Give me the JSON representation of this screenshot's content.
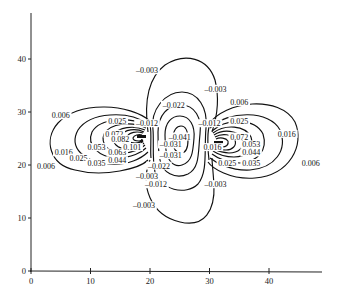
{
  "chart_data": {
    "type": "contour",
    "title": "",
    "xlabel": "",
    "ylabel": "",
    "xlim": [
      0,
      48
    ],
    "ylim": [
      0,
      48
    ],
    "grid": false,
    "legend": null,
    "x_ticks": [
      0,
      10,
      20,
      30,
      40
    ],
    "y_ticks": [
      0,
      10,
      20,
      30,
      40
    ],
    "sources": [
      {
        "name": "left-positive-source",
        "x": 18.5,
        "y": 25,
        "sign": "positive"
      },
      {
        "name": "right-positive-source",
        "x": 31.5,
        "y": 24,
        "sign": "positive"
      },
      {
        "name": "center-negative-region",
        "x": 25,
        "y": 24,
        "sign": "negative"
      }
    ],
    "contour_levels": [
      -0.041,
      -0.031,
      -0.022,
      -0.012,
      -0.003,
      0.006,
      0.016,
      0.025,
      0.035,
      0.044,
      0.053,
      0.063,
      0.072,
      0.082,
      0.091,
      0.101
    ],
    "contour_labels": [
      {
        "text": "-0.003",
        "x": 19.5,
        "y": 37.5
      },
      {
        "text": "-0.003",
        "x": 31,
        "y": 34
      },
      {
        "text": "-0.022",
        "x": 24,
        "y": 31
      },
      {
        "text": "-0.012",
        "x": 19.5,
        "y": 27.5
      },
      {
        "text": "-0.012",
        "x": 30,
        "y": 27.5
      },
      {
        "text": "-0.041",
        "x": 25,
        "y": 25
      },
      {
        "text": "-0.031",
        "x": 23.5,
        "y": 23.5
      },
      {
        "text": "-0.031",
        "x": 23.5,
        "y": 21.5
      },
      {
        "text": "-0.022",
        "x": 21.5,
        "y": 19.5
      },
      {
        "text": "-0.003",
        "x": 19.5,
        "y": 17.5
      },
      {
        "text": "-0.012",
        "x": 21,
        "y": 16
      },
      {
        "text": "-0.003",
        "x": 19,
        "y": 12
      },
      {
        "text": "-0.003",
        "x": 31,
        "y": 16
      },
      {
        "text": "0.006",
        "x": 5,
        "y": 29
      },
      {
        "text": "0.006",
        "x": 2.5,
        "y": 19.5
      },
      {
        "text": "0.016",
        "x": 5.5,
        "y": 22
      },
      {
        "text": "0.025",
        "x": 14.5,
        "y": 28
      },
      {
        "text": "0.025",
        "x": 8,
        "y": 21
      },
      {
        "text": "0.035",
        "x": 11,
        "y": 20
      },
      {
        "text": "0.044",
        "x": 14.5,
        "y": 20.5
      },
      {
        "text": "0.053",
        "x": 11,
        "y": 23
      },
      {
        "text": "0.063",
        "x": 14.5,
        "y": 22
      },
      {
        "text": "0.072",
        "x": 14,
        "y": 25.5
      },
      {
        "text": "0.082",
        "x": 15,
        "y": 24.5
      },
      {
        "text": "0.101",
        "x": 17,
        "y": 23
      },
      {
        "text": "0.006",
        "x": 35,
        "y": 31.5
      },
      {
        "text": "0.025",
        "x": 35,
        "y": 28
      },
      {
        "text": "0.016",
        "x": 43,
        "y": 25.5
      },
      {
        "text": "0.006",
        "x": 47,
        "y": 20
      },
      {
        "text": "0.072",
        "x": 35,
        "y": 25
      },
      {
        "text": "0.053",
        "x": 37,
        "y": 23.5
      },
      {
        "text": "0.044",
        "x": 37,
        "y": 22
      },
      {
        "text": "0.035",
        "x": 37,
        "y": 20
      },
      {
        "text": "0.025",
        "x": 33,
        "y": 20
      },
      {
        "text": "0.016",
        "x": 30.5,
        "y": 23
      }
    ]
  },
  "axes": {
    "x_tick_labels": [
      "0",
      "10",
      "20",
      "30",
      "40"
    ],
    "y_tick_labels": [
      "0",
      "10",
      "20",
      "30",
      "40"
    ]
  }
}
